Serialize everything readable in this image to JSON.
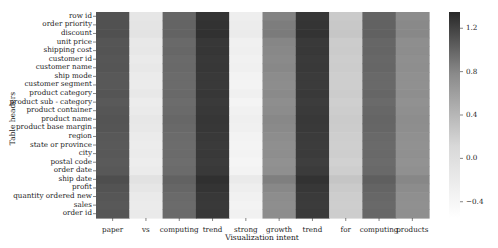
{
  "chart_data": {
    "type": "heatmap",
    "title": "",
    "xlabel": "Visualization intent",
    "ylabel": "Table headers",
    "x_categories": [
      "paper",
      "vs",
      "computing",
      "trend",
      "strong",
      "growth",
      "trend",
      "for",
      "computing",
      "products"
    ],
    "y_categories": [
      "row id",
      "order priority",
      "discount",
      "unit price",
      "shipping cost",
      "customer id",
      "customer name",
      "ship mode",
      "customer segment",
      "product category",
      "product sub - category",
      "product container",
      "product name",
      "product base margin",
      "region",
      "state or province",
      "city",
      "postal code",
      "order date",
      "ship date",
      "profit",
      "quantity ordered new",
      "sales",
      "order id"
    ],
    "column_base_values": [
      0.95,
      -0.35,
      0.78,
      1.22,
      -0.42,
      0.5,
      1.2,
      -0.1,
      0.8,
      0.45
    ],
    "growth_column_values": [
      0.55,
      0.6,
      0.62,
      0.52,
      0.5,
      0.48,
      0.5,
      0.47,
      0.46,
      0.48,
      0.45,
      0.47,
      0.5,
      0.48,
      0.46,
      0.44,
      0.45,
      0.42,
      0.44,
      0.58,
      0.5,
      0.46,
      0.45,
      0.46
    ],
    "row_jitter": [
      0.02,
      0.04,
      0.05,
      0.0,
      0.01,
      -0.01,
      0.0,
      -0.02,
      -0.02,
      0.0,
      -0.03,
      -0.01,
      0.01,
      0.0,
      -0.02,
      -0.03,
      -0.02,
      -0.04,
      -0.02,
      0.06,
      0.02,
      -0.01,
      -0.02,
      -0.01
    ],
    "colorbar": {
      "vmin": -0.55,
      "vmax": 1.35,
      "ticks": [
        1.2,
        0.8,
        0.4,
        0.0,
        -0.4
      ],
      "tick_labels": [
        "1.2",
        "0.8",
        "0.4",
        "0.0",
        "−0.4"
      ],
      "colormap": "Greys"
    },
    "grid": false,
    "legend_position": "right (colorbar)"
  }
}
